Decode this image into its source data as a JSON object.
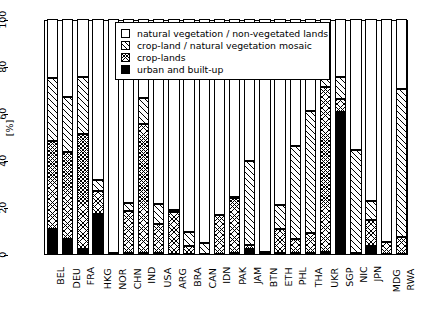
{
  "chart_data": {
    "type": "bar",
    "subtype": "stacked-vertical",
    "title": "",
    "xlabel": "",
    "ylabel": "[%]",
    "ylim": [
      0,
      100
    ],
    "yticks": [
      0,
      20,
      40,
      60,
      80,
      100
    ],
    "ytick_labels": [
      "0",
      "20",
      "40",
      "60",
      "80",
      "100"
    ],
    "grid": false,
    "legend_position": "top-center-inside",
    "stack_order_bottom_to_top": [
      "urban and built-up",
      "crop-lands",
      "crop-land / natural vegetation mosaic",
      "natural vegetation / non-vegetated lands"
    ],
    "categories": [
      "BEL",
      "DEU",
      "FRA",
      "HKG",
      "NOR",
      "CHN",
      "IND",
      "USA",
      "ARG",
      "BRA",
      "CAN",
      "IDN",
      "PAK",
      "JAM",
      "BTN",
      "ETH",
      "PHL",
      "THA",
      "UKR",
      "SGP",
      "NIC",
      "JPN",
      "MDG",
      "RWA"
    ],
    "series": [
      {
        "name": "urban and built-up",
        "fill": "solid-black",
        "values": [
          10.5,
          6.5,
          2.0,
          17.0,
          0.3,
          0.3,
          0.3,
          0.3,
          0.2,
          0.2,
          0.2,
          0.2,
          0.3,
          2.2,
          0.3,
          0.3,
          0.3,
          0.3,
          1.0,
          60.5,
          0.3,
          3.4,
          0.2,
          0.2
        ]
      },
      {
        "name": "crop-lands",
        "fill": "cross-hatch",
        "values": [
          37.5,
          37.0,
          49.0,
          10.0,
          0.0,
          18.0,
          55.0,
          12.5,
          17.5,
          3.0,
          0.0,
          16.5,
          23.5,
          1.5,
          0.0,
          10.5,
          6.0,
          8.5,
          70.0,
          5.5,
          0.0,
          11.0,
          5.0,
          7.0
        ]
      },
      {
        "name": "crop-land / natural vegetation mosaic",
        "fill": "diagonal-hatch",
        "values": [
          27.0,
          23.5,
          24.5,
          4.5,
          0.0,
          3.5,
          11.0,
          8.5,
          1.0,
          6.0,
          4.5,
          0.0,
          0.5,
          36.0,
          0.5,
          10.0,
          39.5,
          52.0,
          13.0,
          9.5,
          44.0,
          8.0,
          0.0,
          63.0
        ]
      },
      {
        "name": "natural vegetation / non-vegetated lands",
        "fill": "white",
        "values": [
          25.0,
          33.0,
          24.5,
          68.5,
          99.7,
          78.2,
          33.7,
          78.7,
          81.3,
          90.8,
          95.3,
          83.3,
          75.7,
          60.3,
          99.2,
          79.2,
          54.2,
          39.2,
          16.0,
          24.5,
          55.7,
          77.6,
          94.8,
          29.8
        ]
      }
    ],
    "stack_tops": {
      "BEL": {
        "urban": 10.5,
        "crop": 48.0,
        "mosaic": 75.0,
        "natural": 100
      },
      "DEU": {
        "urban": 6.5,
        "crop": 43.5,
        "mosaic": 67.0,
        "natural": 100
      },
      "FRA": {
        "urban": 2.0,
        "crop": 51.0,
        "mosaic": 75.5,
        "natural": 100
      },
      "HKG": {
        "urban": 17.0,
        "crop": 27.0,
        "mosaic": 31.5,
        "natural": 100
      },
      "NOR": {
        "urban": 0.3,
        "crop": 0.3,
        "mosaic": 0.3,
        "natural": 100
      },
      "CHN": {
        "urban": 0.3,
        "crop": 18.3,
        "mosaic": 21.8,
        "natural": 100
      },
      "IND": {
        "urban": 0.3,
        "crop": 55.3,
        "mosaic": 66.3,
        "natural": 100
      },
      "USA": {
        "urban": 0.3,
        "crop": 12.8,
        "mosaic": 21.3,
        "natural": 100
      },
      "ARG": {
        "urban": 0.2,
        "crop": 17.7,
        "mosaic": 18.7,
        "natural": 100
      },
      "BRA": {
        "urban": 0.2,
        "crop": 3.2,
        "mosaic": 9.2,
        "natural": 100
      },
      "CAN": {
        "urban": 0.2,
        "crop": 0.2,
        "mosaic": 4.7,
        "natural": 100
      },
      "IDN": {
        "urban": 0.2,
        "crop": 16.7,
        "mosaic": 16.7,
        "natural": 100
      },
      "PAK": {
        "urban": 0.3,
        "crop": 23.8,
        "mosaic": 24.3,
        "natural": 100
      },
      "JAM": {
        "urban": 2.2,
        "crop": 3.7,
        "mosaic": 39.7,
        "natural": 100
      },
      "BTN": {
        "urban": 0.3,
        "crop": 0.3,
        "mosaic": 0.8,
        "natural": 100
      },
      "ETH": {
        "urban": 0.3,
        "crop": 10.8,
        "mosaic": 20.8,
        "natural": 100
      },
      "PHL": {
        "urban": 0.3,
        "crop": 6.3,
        "mosaic": 45.8,
        "natural": 100
      },
      "THA": {
        "urban": 0.3,
        "crop": 8.8,
        "mosaic": 60.8,
        "natural": 100
      },
      "UKR": {
        "urban": 1.0,
        "crop": 71.0,
        "mosaic": 84.0,
        "natural": 100
      },
      "SGP": {
        "urban": 60.5,
        "crop": 66.0,
        "mosaic": 75.5,
        "natural": 100
      },
      "NIC": {
        "urban": 0.3,
        "crop": 0.3,
        "mosaic": 44.3,
        "natural": 100
      },
      "JPN": {
        "urban": 3.4,
        "crop": 14.4,
        "mosaic": 22.4,
        "natural": 100
      },
      "MDG": {
        "urban": 0.2,
        "crop": 5.2,
        "mosaic": 5.2,
        "natural": 100
      },
      "RWA": {
        "urban": 0.2,
        "crop": 7.2,
        "mosaic": 70.2,
        "natural": 100
      }
    },
    "legend": [
      {
        "label": "natural vegetation / non-vegetated lands",
        "key": "natural"
      },
      {
        "label": "crop-land / natural vegetation mosaic",
        "key": "mosaic"
      },
      {
        "label": "crop-lands",
        "key": "crop"
      },
      {
        "label": "urban and built-up",
        "key": "urban"
      }
    ],
    "colors": {
      "urban": "#000000",
      "hatch": "#000000",
      "background": "#ffffff",
      "axis": "#000000"
    }
  }
}
